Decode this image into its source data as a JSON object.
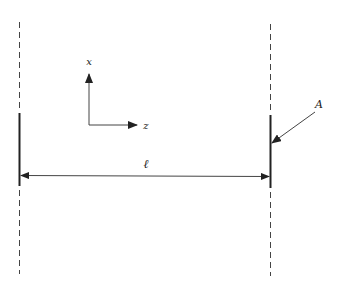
{
  "diagram": {
    "labels": {
      "x_axis": "x",
      "z_axis": "z",
      "length": "ℓ",
      "pointer": "A"
    },
    "colors": {
      "line": "#222222",
      "thin_line": "#444444",
      "background": "#ffffff"
    },
    "elements": {
      "left_boundary": "dashed vertical line with solid segment (mirror)",
      "right_boundary": "dashed vertical line with solid segment (mirror)",
      "dimension": "double-headed arrow between the two solid segments",
      "axes": "x (up) and z (right) coordinate axes",
      "pointer": "leader arrow from label A to right solid segment"
    }
  }
}
